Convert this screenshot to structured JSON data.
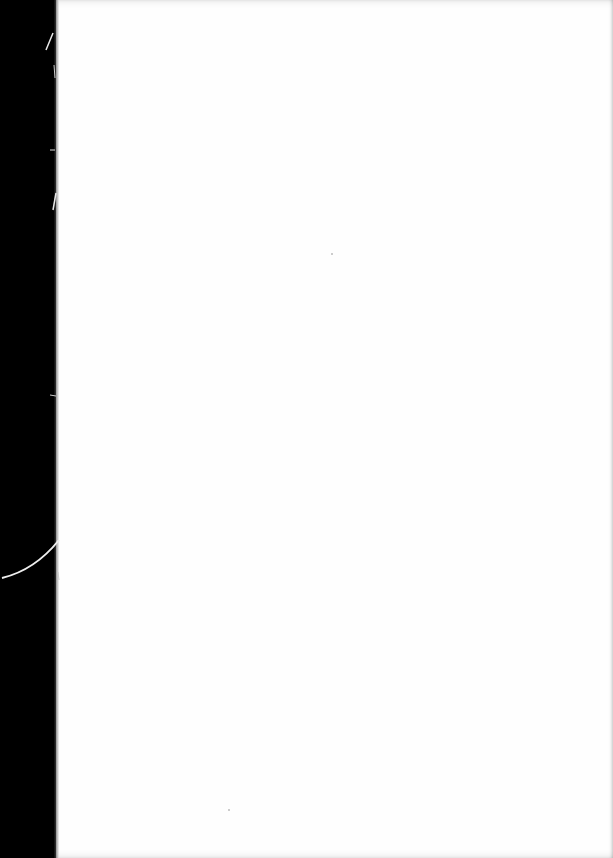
{
  "document": {
    "type": "scanned-page",
    "content": "",
    "page_color": "#fefefe",
    "background_color": "#000000"
  }
}
